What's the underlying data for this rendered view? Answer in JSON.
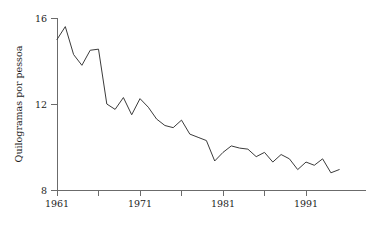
{
  "chart_data": {
    "type": "line",
    "title": "",
    "subtitle": "",
    "xlabel": "",
    "ylabel": "Quilogramas por pessoa",
    "xlim": [
      1961,
      1996
    ],
    "ylim": [
      8,
      16
    ],
    "grid": false,
    "legend": null,
    "x_ticks": [
      1961,
      1971,
      1981,
      1991
    ],
    "x_minor_ticks": [
      1966,
      1976,
      1986
    ],
    "y_ticks": [
      8,
      12,
      16
    ],
    "x": [
      1961,
      1962,
      1963,
      1964,
      1965,
      1966,
      1967,
      1968,
      1969,
      1970,
      1971,
      1972,
      1973,
      1974,
      1975,
      1976,
      1977,
      1978,
      1979,
      1980,
      1981,
      1982,
      1983,
      1984,
      1985,
      1986,
      1987,
      1988,
      1989,
      1990,
      1991,
      1992,
      1993,
      1994,
      1995
    ],
    "values": [
      15.0,
      15.6,
      14.3,
      13.8,
      14.5,
      14.55,
      12.0,
      11.75,
      12.3,
      11.5,
      12.25,
      11.85,
      11.3,
      11.0,
      10.9,
      11.25,
      10.6,
      10.45,
      10.3,
      9.35,
      9.75,
      10.05,
      9.95,
      9.9,
      9.55,
      9.75,
      9.3,
      9.65,
      9.45,
      8.95,
      9.3,
      9.15,
      9.45,
      8.8,
      8.95
    ],
    "series": [
      {
        "name": "Consumo per capita",
        "values": [
          15.0,
          15.6,
          14.3,
          13.8,
          14.5,
          14.55,
          12.0,
          11.75,
          12.3,
          11.5,
          12.25,
          11.85,
          11.3,
          11.0,
          10.9,
          11.25,
          10.6,
          10.45,
          10.3,
          9.35,
          9.75,
          10.05,
          9.95,
          9.9,
          9.55,
          9.75,
          9.3,
          9.65,
          9.45,
          8.95,
          9.3,
          9.15,
          9.45,
          8.8,
          8.95
        ],
        "color": "#3b3b3b"
      }
    ],
    "colors": {
      "line": "#3b3b3b",
      "axis": "#6b6b6b",
      "text": "#1c1c1c",
      "background": "#ffffff"
    }
  }
}
